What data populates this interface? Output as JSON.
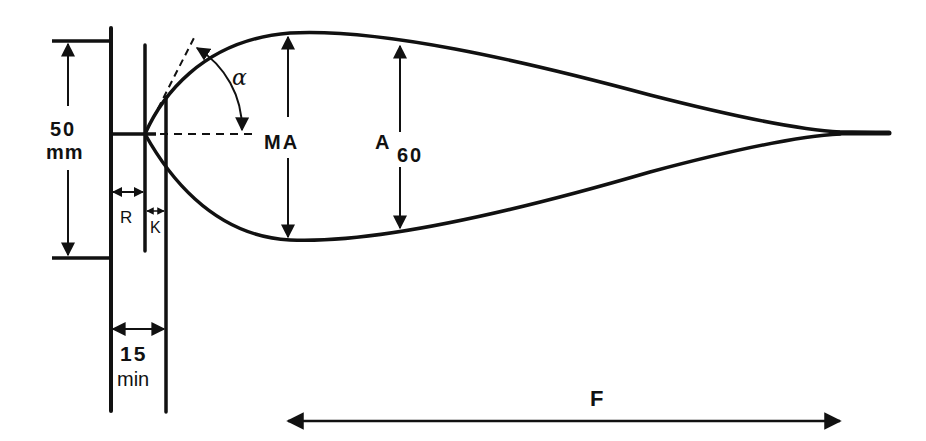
{
  "diagram": {
    "type": "technical-measurement-drawing",
    "stroke_color": "#111111",
    "background": "#ffffff",
    "labels": {
      "height_value": "50",
      "height_unit": "mm",
      "r_label": "R",
      "k_label": "K",
      "width_value": "15",
      "width_unit": "min",
      "alpha_label": "α",
      "ma_label": "MA",
      "a60_main": "A",
      "a60_sub": "60",
      "f_label": "F"
    }
  }
}
